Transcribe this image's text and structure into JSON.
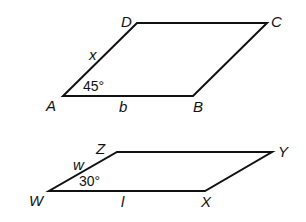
{
  "figures": [
    {
      "name": "parallelogram-ABCD",
      "vertices": {
        "A": "A",
        "B": "B",
        "C": "C",
        "D": "D"
      },
      "side_labels": {
        "AD": "x",
        "AB": "b"
      },
      "angle_label": "45°"
    },
    {
      "name": "parallelogram-WXYZ",
      "vertices": {
        "W": "W",
        "X": "X",
        "Y": "Y",
        "Z": "Z"
      },
      "side_labels": {
        "WZ": "w",
        "WX": "l"
      },
      "angle_label": "30°"
    }
  ],
  "colors": {
    "stroke": "#111111",
    "background": "#ffffff"
  }
}
